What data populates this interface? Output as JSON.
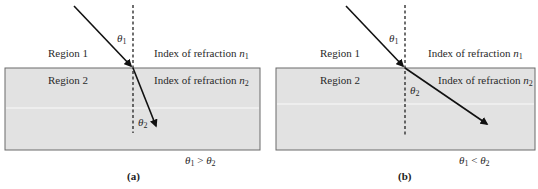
{
  "figure": {
    "panels": [
      {
        "id": "a",
        "caption": "(a)",
        "region1_label": "Region 1",
        "region2_label": "Region 2",
        "index1_text": "Index of refraction ",
        "index1_symbol": "n",
        "index1_sub": "1",
        "index2_text": "Index of refraction ",
        "index2_symbol": "n",
        "index2_sub": "2",
        "theta1_symbol": "θ",
        "theta1_sub": "1",
        "theta2_symbol": "θ",
        "theta2_sub": "2",
        "relation": {
          "lhs": "θ",
          "lhs_sub": "1",
          "op": " > ",
          "rhs": "θ",
          "rhs_sub": "2"
        }
      },
      {
        "id": "b",
        "caption": "(b)",
        "region1_label": "Region 1",
        "region2_label": "Region 2",
        "index1_text": "Index of refraction ",
        "index1_symbol": "n",
        "index1_sub": "1",
        "index2_text": "Index of refraction ",
        "index2_symbol": "n",
        "index2_sub": "2",
        "theta1_symbol": "θ",
        "theta1_sub": "1",
        "theta2_symbol": "θ",
        "theta2_sub": "2",
        "relation": {
          "lhs": "θ",
          "lhs_sub": "1",
          "op": " < ",
          "rhs": "θ",
          "rhs_sub": "2"
        }
      }
    ],
    "colors": {
      "region2_fill": "#e2e2e2",
      "border": "#6a6a6a",
      "ray": "#111111"
    }
  }
}
